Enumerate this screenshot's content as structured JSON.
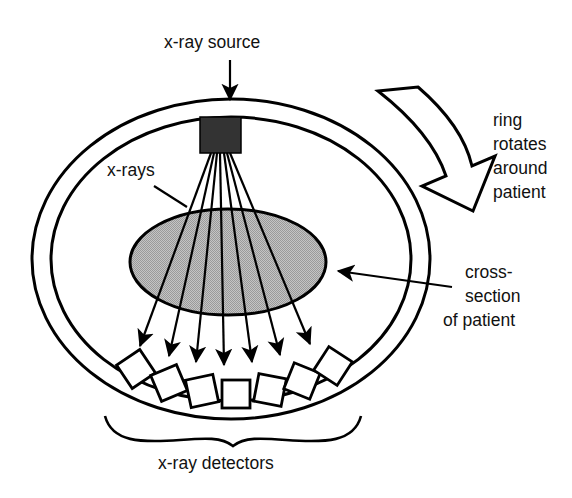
{
  "figure": {
    "background_color": "#ffffff",
    "line_color": "#000000",
    "patient_fill_color": "#b0b0b0",
    "source_fill_color": "#333333"
  },
  "labels": {
    "source": "x-ray source",
    "rays": "x-rays",
    "rotation_line1": "ring",
    "rotation_line2": "rotates",
    "rotation_line3": "around",
    "rotation_line4": "patient",
    "cross_section_line1": "cross-",
    "cross_section_line2": "section",
    "cross_section_line3": "of patient",
    "detectors": "x-ray detectors"
  },
  "parts": {
    "ring_name": "gantry-ring",
    "source_name": "x-ray-source-block",
    "patient_name": "patient-cross-section",
    "detector_count": 7,
    "ray_count": 7
  },
  "geometry": {
    "ring_outer": {
      "cx": 231,
      "cy": 259,
      "rx": 199,
      "ry": 160
    },
    "ring_inner": {
      "cx": 231,
      "cy": 259,
      "rx": 180,
      "ry": 142
    },
    "patient": {
      "cx": 228,
      "cy": 262,
      "rx": 98,
      "ry": 53
    },
    "source": {
      "x": 200,
      "y": 117,
      "w": 41,
      "h": 36
    },
    "fan_origin": {
      "x": 220,
      "y": 153
    }
  }
}
